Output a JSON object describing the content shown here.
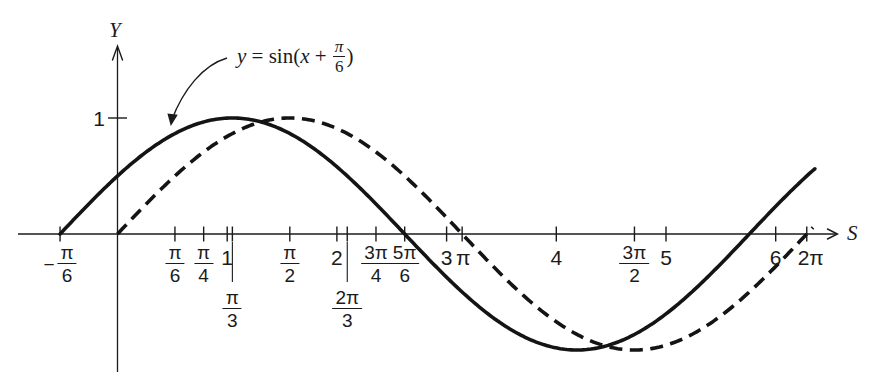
{
  "chart_data": {
    "type": "line",
    "xlabel": "S",
    "ylabel": "Y",
    "xlim": [
      -0.9,
      6.9
    ],
    "ylim": [
      -1.35,
      1.7
    ],
    "grid": false,
    "background": "#ffffff",
    "axis_color": "#1b1b1b",
    "curve_color": "#141414",
    "series": [
      {
        "name": "y = sin(x + π/6)",
        "function": "sin",
        "amplitude": 1,
        "phase_shift": 0.5235987755982988,
        "x_start": -0.5235987755982988,
        "x_end": 6.37,
        "line_style": "solid"
      },
      {
        "name": "y = sin x",
        "function": "sin",
        "amplitude": 1,
        "phase_shift": 0,
        "x_start": 0,
        "x_end": 6.35,
        "line_style": "dashed"
      }
    ],
    "x_ticks": [
      {
        "value": -0.5235987755982988,
        "prefix": "−",
        "num": "π",
        "den": "6"
      },
      {
        "value": 0.5235987755982988,
        "num": "π",
        "den": "6"
      },
      {
        "value": 0.7853981633974483,
        "num": "π",
        "den": "4"
      },
      {
        "value": 1,
        "text": "1"
      },
      {
        "value": 1.0471975511965976,
        "num": "π",
        "den": "3",
        "dropped": true
      },
      {
        "value": 1.5707963267948966,
        "num": "π",
        "den": "2"
      },
      {
        "value": 2,
        "text": "2"
      },
      {
        "value": 2.0943951023931953,
        "num": "2π",
        "den": "3",
        "dropped": true
      },
      {
        "value": 2.356194490192345,
        "num": "3π",
        "den": "4"
      },
      {
        "value": 2.617993877991494,
        "num": "5π",
        "den": "6"
      },
      {
        "value": 3,
        "text": "3"
      },
      {
        "value": 3.141592653589793,
        "text": "π",
        "dx": 1
      },
      {
        "value": 4,
        "text": "4"
      },
      {
        "value": 4.71238898038469,
        "num": "3π",
        "den": "2"
      },
      {
        "value": 5,
        "text": "5"
      },
      {
        "value": 6,
        "text": "6"
      },
      {
        "value": 6.283185307179586,
        "text": "2π",
        "dx": 4
      }
    ],
    "y_ticks": [
      {
        "value": 1,
        "text": "1"
      }
    ],
    "annotation": {
      "lhs": "y",
      "eq": " = ",
      "func": "sin",
      "open_paren": "(",
      "arg": "x",
      "plus": " + ",
      "frac_num": "π",
      "frac_den": "6",
      "close_paren": ")"
    }
  }
}
